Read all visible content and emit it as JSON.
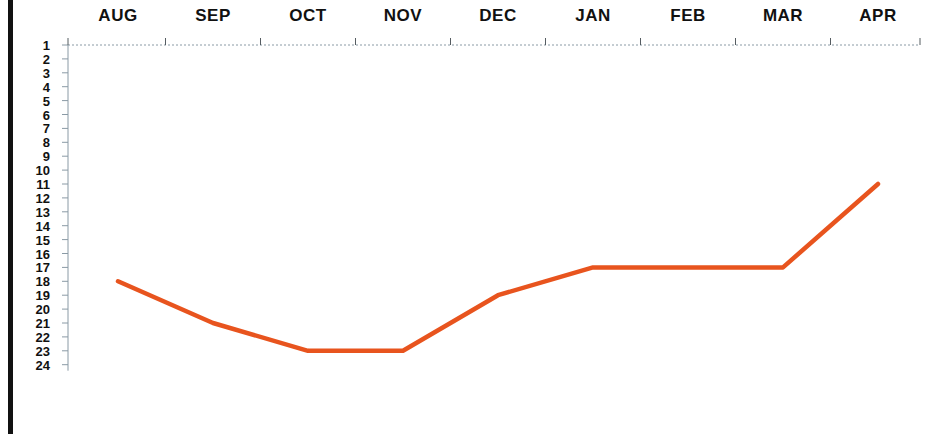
{
  "chart_data": {
    "type": "line",
    "title": "",
    "subtitle": "",
    "xlabel": "",
    "ylabel": "",
    "categories": [
      "AUG",
      "SEP",
      "OCT",
      "NOV",
      "DEC",
      "JAN",
      "FEB",
      "MAR",
      "APR"
    ],
    "series": [
      {
        "name": "Rank",
        "values": [
          18,
          21,
          23,
          23,
          19,
          17,
          17,
          17,
          11
        ],
        "color": "#E8541E"
      }
    ],
    "y_ticks": [
      1,
      2,
      3,
      4,
      5,
      6,
      7,
      8,
      9,
      10,
      11,
      12,
      13,
      14,
      15,
      16,
      17,
      18,
      19,
      20,
      21,
      22,
      23,
      24
    ],
    "ylim": [
      1,
      24
    ],
    "y_axis_inverted": true,
    "grid": false,
    "legend": "none",
    "axis_color": "#8a9aa5",
    "label_color": "#111111",
    "background": "#ffffff"
  },
  "frame": {
    "left_rule_color": "#111111"
  }
}
